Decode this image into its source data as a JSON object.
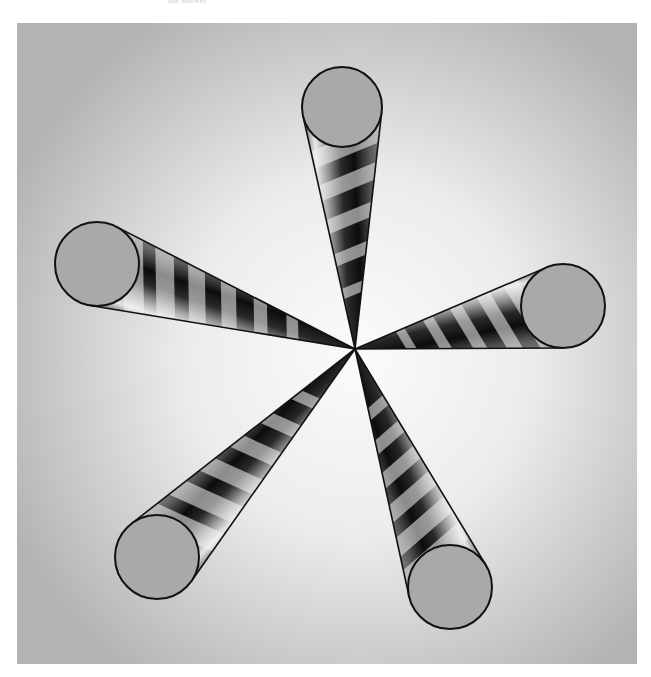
{
  "caption": "the answer",
  "scene": {
    "description": "Five metallic striped cones meeting at a central apex, bases shown as grey circles",
    "frame": {
      "x": 17,
      "y": 23,
      "width": 620,
      "height": 641
    },
    "background": {
      "center_color": "#fbfbfb",
      "edge_color": "#b3b3b3"
    },
    "apex": {
      "x": 355,
      "y": 349
    },
    "cap_fill": "#a9a9a9",
    "outline_color": "#111111",
    "stripe_light": "#f4f4f4",
    "cones": [
      {
        "name": "top",
        "cx": 342,
        "cy": 107,
        "r": 40,
        "stripes": 5
      },
      {
        "name": "left",
        "cx": 97,
        "cy": 264,
        "r": 42,
        "stripes": 6
      },
      {
        "name": "right",
        "cx": 563,
        "cy": 306,
        "r": 42,
        "stripes": 5
      },
      {
        "name": "bottom-left",
        "cx": 157,
        "cy": 557,
        "r": 42,
        "stripes": 6
      },
      {
        "name": "bottom-right",
        "cx": 450,
        "cy": 587,
        "r": 42,
        "stripes": 6
      }
    ]
  }
}
